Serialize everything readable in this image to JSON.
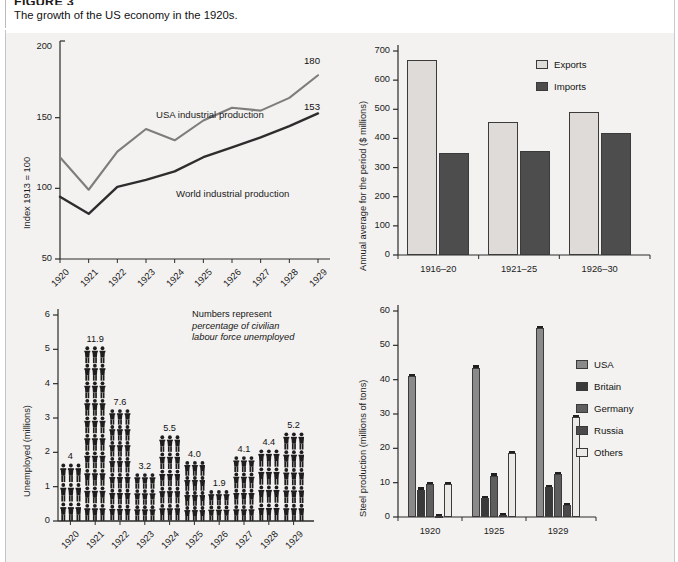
{
  "figure": {
    "number": "FIGURE 3",
    "title": "The growth of the US economy in the 1920s."
  },
  "chart_data": [
    {
      "id": "industrial-production",
      "type": "line",
      "title": "",
      "xlabel": "",
      "ylabel": "Index 1913 = 100",
      "x": [
        "1920",
        "1921",
        "1922",
        "1923",
        "1924",
        "1925",
        "1926",
        "1927",
        "1928",
        "1929"
      ],
      "ylim": [
        50,
        200
      ],
      "yticks": [
        50,
        100,
        150,
        200
      ],
      "grid": false,
      "series": [
        {
          "name": "USA industrial production",
          "color": "#7d7d7d",
          "end_label": "180",
          "values": [
            122,
            99,
            126,
            142,
            134,
            148,
            157,
            155,
            164,
            180
          ]
        },
        {
          "name": "World industrial production",
          "color": "#2d2d2d",
          "end_label": "153",
          "values": [
            94,
            82,
            101,
            106,
            112,
            122,
            129,
            136,
            144,
            153
          ]
        }
      ],
      "annotations": [
        {
          "text": "USA industrial production"
        },
        {
          "text": "World industrial production"
        }
      ]
    },
    {
      "id": "trade",
      "type": "bar",
      "title": "",
      "xlabel": "",
      "ylabel": "Annual average for the period ($ millions)",
      "categories": [
        "1916–20",
        "1921–25",
        "1926–30"
      ],
      "ylim": [
        0,
        700
      ],
      "yticks": [
        0,
        100,
        200,
        300,
        400,
        500,
        600,
        700
      ],
      "grid": false,
      "legend_position": "top-right",
      "series": [
        {
          "name": "Exports",
          "color": "#dedbd8",
          "values": [
            670,
            455,
            490
          ]
        },
        {
          "name": "Imports",
          "color": "#4d4d4d",
          "values": [
            350,
            358,
            420
          ]
        }
      ]
    },
    {
      "id": "unemployment",
      "type": "bar",
      "title": "",
      "xlabel": "",
      "ylabel": "Unemployed (millions)",
      "categories": [
        "1920",
        "1921",
        "1922",
        "1923",
        "1924",
        "1925",
        "1926",
        "1927",
        "1928",
        "1929"
      ],
      "values": [
        1.7,
        5.1,
        3.25,
        1.4,
        2.5,
        1.75,
        0.9,
        1.9,
        2.1,
        2.6
      ],
      "data_labels": [
        "4",
        "11.9",
        "7.6",
        "3.2",
        "5.5",
        "4.0",
        "1.9",
        "4.1",
        "4.4",
        "5.2"
      ],
      "ylim": [
        0,
        6
      ],
      "yticks": [
        0,
        1,
        2,
        3,
        4,
        5,
        6
      ],
      "grid": false,
      "note_lines": [
        "Numbers represent",
        "percentage of civilian",
        "labour force unemployed"
      ],
      "note_italic_from": 1
    },
    {
      "id": "steel-production",
      "type": "bar",
      "title": "",
      "xlabel": "",
      "ylabel": "Steel production (millions of tons)",
      "categories": [
        "1920",
        "1925",
        "1929"
      ],
      "ylim": [
        0,
        60
      ],
      "yticks": [
        0,
        10,
        20,
        30,
        40,
        50,
        60
      ],
      "grid": false,
      "legend_position": "right",
      "series": [
        {
          "name": "USA",
          "color": "#8a8a8a",
          "values": [
            41.0,
            43.5,
            55.0
          ]
        },
        {
          "name": "Britain",
          "color": "#3a3a3a",
          "values": [
            8.0,
            5.5,
            8.6
          ]
        },
        {
          "name": "Germany",
          "color": "#5e5e5e",
          "values": [
            9.5,
            12.0,
            12.5
          ]
        },
        {
          "name": "Russia",
          "color": "#4a4a4a",
          "values": [
            0.3,
            0.5,
            3.5
          ]
        },
        {
          "name": "Others",
          "color": "#eceae7",
          "values": [
            9.5,
            18.5,
            29.0
          ]
        }
      ]
    }
  ]
}
